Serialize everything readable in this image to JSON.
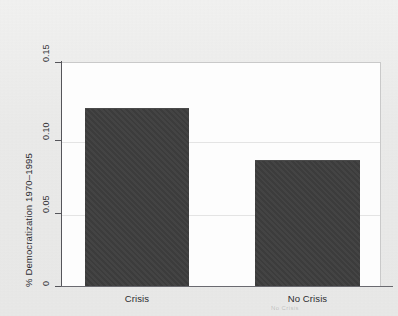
{
  "figure": {
    "background_color": "#ebebea",
    "plot_background_color": "#fdfdfd",
    "bar_color": "#3d3d3d",
    "axis_color": "#55555a",
    "gridline_color": "#e4e4e4",
    "ghost_artifact": "No Crisis"
  },
  "chart_data": {
    "type": "bar",
    "title": "",
    "subtitle": "",
    "xlabel": "",
    "ylabel": "% Democratization 1970–1995",
    "categories": [
      "Crisis",
      "No Crisis"
    ],
    "values": [
      0.123,
      0.087
    ],
    "series": [
      {
        "name": "% Democratization 1970–1995",
        "values": [
          0.123,
          0.087
        ]
      }
    ],
    "ylim": [
      0,
      0.155
    ],
    "yticks": [
      0,
      0.05,
      0.1,
      0.15
    ],
    "ytick_labels": [
      "0",
      "0.05",
      "0.10",
      "0.15"
    ],
    "xtick_labels": [
      "Crisis",
      "No Crisis"
    ],
    "grid": true,
    "grid_axis": "y",
    "legend": null,
    "legend_position": "none",
    "annotations": []
  }
}
